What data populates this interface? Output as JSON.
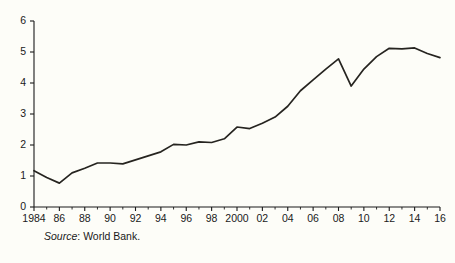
{
  "chart_data": {
    "type": "line",
    "title": "",
    "subtitle": "",
    "xlabel": "",
    "ylabel": "",
    "xlim": [
      1984,
      2016
    ],
    "ylim": [
      0,
      6
    ],
    "grid": false,
    "legend": null,
    "y_ticks": [
      "0",
      "1",
      "2",
      "3",
      "4",
      "5",
      "6"
    ],
    "y_tick_values": [
      0,
      1,
      2,
      3,
      4,
      5,
      6
    ],
    "x_tick_labels": [
      "1984",
      "86",
      "88",
      "90",
      "92",
      "94",
      "96",
      "98",
      "2000",
      "02",
      "04",
      "06",
      "08",
      "10",
      "12",
      "14",
      "16"
    ],
    "x_tick_values": [
      1984,
      1986,
      1988,
      1990,
      1992,
      1994,
      1996,
      1998,
      2000,
      2002,
      2004,
      2006,
      2008,
      2010,
      2012,
      2014,
      2016
    ],
    "x_minor_ticks": [
      1985,
      1987,
      1989,
      1991,
      1993,
      1995,
      1997,
      1999,
      2001,
      2003,
      2005,
      2007,
      2009,
      2011,
      2013,
      2015
    ],
    "x": [
      1984,
      1985,
      1986,
      1987,
      1988,
      1989,
      1990,
      1991,
      1992,
      1993,
      1994,
      1995,
      1996,
      1997,
      1998,
      1999,
      2000,
      2001,
      2002,
      2003,
      2004,
      2005,
      2006,
      2007,
      2008,
      2009,
      2010,
      2011,
      2012,
      2013,
      2014,
      2015,
      2016
    ],
    "series": [
      {
        "name": "",
        "color": "#262420",
        "values": [
          1.17,
          0.95,
          0.77,
          1.1,
          1.25,
          1.42,
          1.42,
          1.39,
          1.52,
          1.65,
          1.78,
          2.02,
          2.0,
          2.1,
          2.08,
          2.2,
          2.58,
          2.53,
          2.7,
          2.9,
          3.25,
          3.75,
          4.1,
          4.45,
          4.78,
          3.9,
          4.45,
          4.85,
          5.12,
          5.1,
          5.13,
          4.95,
          4.82
        ]
      }
    ]
  },
  "source": {
    "label": "Source",
    "separator": ": ",
    "text": "World Bank."
  }
}
